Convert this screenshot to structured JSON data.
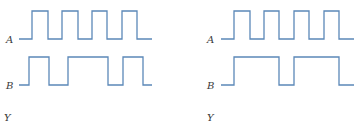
{
  "colors": {
    "waveform": "#5b88b8",
    "label": "#3a3a3a",
    "background": "#ffffff"
  },
  "diagrams": [
    {
      "name": "left",
      "signals": [
        {
          "label": "A",
          "label_pos": [
            6,
            35
          ],
          "points": "19,39 32,39 32,11 48,11 48,39 62,39 62,11 78,11 78,39 92,39 92,11 107,11 107,39 122,39 122,11 137,11 137,39 152,39"
        },
        {
          "label": "B",
          "label_pos": [
            6,
            81
          ],
          "points": "19,85 29,85 29,57 49,57 49,85 68,85 68,57 108,57 108,85 123,85 123,57 143,57 143,85 152,85"
        }
      ],
      "output_label": "Y",
      "output_label_pos": [
        4,
        113
      ]
    },
    {
      "name": "right",
      "signals": [
        {
          "label": "A",
          "label_pos": [
            207,
            35
          ],
          "points": "221,39 234,39 234,11 250,11 250,39 264,39 264,11 279,11 279,39 294,39 294,11 309,11 309,39 324,39 324,11 339,11 339,39 354,39"
        },
        {
          "label": "B",
          "label_pos": [
            207,
            81
          ],
          "points": "221,85 234,85 234,57 279,57 279,85 294,85 294,57 339,57 339,85 354,85"
        }
      ],
      "output_label": "Y",
      "output_label_pos": [
        207,
        113
      ]
    }
  ]
}
